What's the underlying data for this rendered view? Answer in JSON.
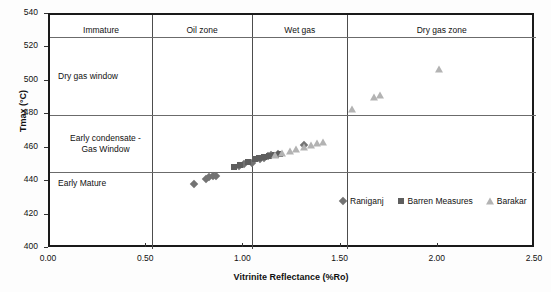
{
  "chart_data": {
    "type": "scatter",
    "title": "",
    "xlabel": "Vitrinite Reflectance (%Ro)",
    "ylabel": "Tmax (°C)",
    "xlim": [
      0.0,
      2.5
    ],
    "ylim": [
      400,
      540
    ],
    "xticks": [
      "0.00",
      "0.50",
      "1.00",
      "1.50",
      "2.00",
      "2.50"
    ],
    "xtick_values": [
      0.0,
      0.5,
      1.0,
      1.5,
      2.0,
      2.5
    ],
    "yticks": [
      "400",
      "420",
      "440",
      "460",
      "480",
      "500",
      "520",
      "540"
    ],
    "ytick_values": [
      400,
      420,
      440,
      460,
      480,
      500,
      520,
      540
    ],
    "grid": false,
    "legend_position": "inside-lower-right",
    "series": [
      {
        "name": "Raniganj",
        "marker": "diamond",
        "color": "#737373",
        "points": [
          [
            0.74,
            438.8
          ],
          [
            0.8,
            441.9
          ],
          [
            0.82,
            442.8
          ],
          [
            0.84,
            443.6
          ],
          [
            0.855,
            443.8
          ],
          [
            0.97,
            449.5
          ],
          [
            1.0,
            450.6
          ],
          [
            1.04,
            451.2
          ],
          [
            1.08,
            453.8
          ],
          [
            1.1,
            454.6
          ],
          [
            1.12,
            455.4
          ],
          [
            1.135,
            456.0
          ],
          [
            1.175,
            456.6
          ],
          [
            1.305,
            462.2
          ]
        ]
      },
      {
        "name": "Barren Measures",
        "marker": "square",
        "color": "#5e5e5e",
        "points": [
          [
            0.945,
            449.2
          ],
          [
            0.975,
            450.2
          ],
          [
            1.02,
            452.0
          ],
          [
            1.055,
            453.8
          ],
          [
            1.075,
            454.3
          ],
          [
            1.1,
            455.0
          ],
          [
            1.125,
            455.6
          ],
          [
            1.155,
            456.3
          ],
          [
            1.185,
            457.0
          ]
        ]
      },
      {
        "name": "Barakar",
        "marker": "triangle",
        "color": "#b3b3b3",
        "points": [
          [
            1.155,
            456.2
          ],
          [
            1.195,
            457.6
          ],
          [
            1.235,
            458.6
          ],
          [
            1.265,
            459.6
          ],
          [
            1.305,
            460.8
          ],
          [
            1.345,
            462.2
          ],
          [
            1.375,
            463.2
          ],
          [
            1.405,
            463.8
          ],
          [
            1.555,
            484.0
          ],
          [
            1.665,
            491.2
          ],
          [
            1.695,
            492.2
          ],
          [
            2.0,
            507.5
          ]
        ]
      }
    ],
    "maturity_zones_horizontal": [
      {
        "label": "Immature",
        "tmax_top": 540,
        "tmax_bottom": 527
      },
      {
        "label": "Dry gas window",
        "tmax_top": 527,
        "tmax_bottom": 480
      },
      {
        "label": "Early condensate -\nGas Window",
        "tmax_top": 480,
        "tmax_bottom": 446
      },
      {
        "label": "Early Mature",
        "tmax_top": 446,
        "tmax_bottom": 400
      }
    ],
    "maturity_zones_vertical": [
      {
        "label": "Immature",
        "ro_start": 0.0,
        "ro_end": 0.525
      },
      {
        "label": "Oil zone",
        "ro_start": 0.525,
        "ro_end": 1.04
      },
      {
        "label": "Wet gas",
        "ro_start": 1.04,
        "ro_end": 1.53
      },
      {
        "label": "Dry gas zone",
        "ro_start": 1.53,
        "ro_end": 2.5
      }
    ],
    "zone_divider_ro": [
      0.525,
      1.04,
      1.53
    ],
    "zone_divider_tmax": [
      527,
      480,
      446
    ],
    "legend_entries": [
      {
        "label": "Raniganj",
        "marker": "diamond",
        "color": "#737373"
      },
      {
        "label": "Barren Measures",
        "marker": "square",
        "color": "#5e5e5e"
      },
      {
        "label": "Barakar",
        "marker": "triangle",
        "color": "#b3b3b3"
      }
    ]
  }
}
